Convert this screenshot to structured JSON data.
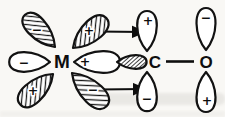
{
  "diagram": {
    "title_semantic": "sigma-donation and pi-back-donation in M-CO bonding",
    "atoms": {
      "metal": "M",
      "carbon": "C",
      "oxygen": "O"
    },
    "signs": {
      "m_lobe_upper_left": "−",
      "m_lobe_left": "−",
      "m_lobe_lower_left": "+",
      "m_lobe_upper_right": "+",
      "m_lobe_right": "+",
      "m_lobe_lower_right": "−",
      "c_lobe_top": "+",
      "c_lobe_bottom": "−",
      "o_lobe_top": "−",
      "o_lobe_bottom": "+"
    },
    "colors": {
      "ink": "#0e0e0e",
      "paper": "#f9f8f5",
      "lobe_fill": "#ffffff"
    }
  }
}
